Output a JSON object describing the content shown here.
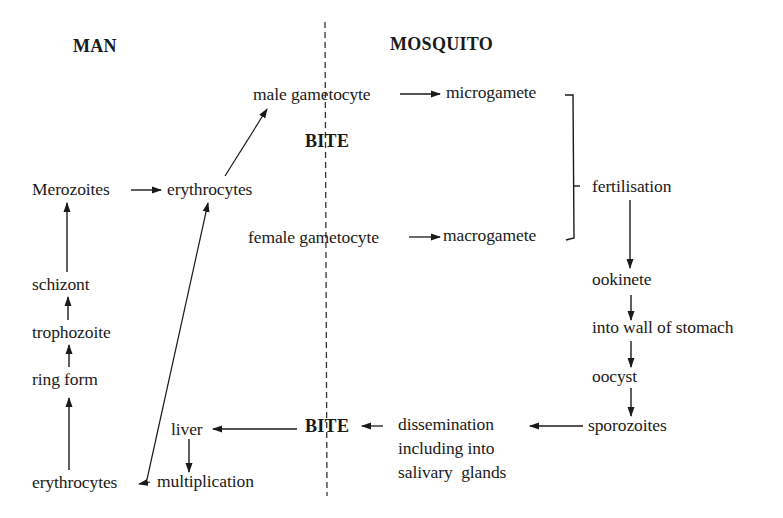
{
  "diagram": {
    "type": "life-cycle flowchart",
    "regions": {
      "left_header": "MAN",
      "right_header": "MOSQUITO",
      "divider": "dashed vertical line separating host (man) and vector (mosquito)"
    },
    "nodes": {
      "male_gametocyte": "male gametocyte",
      "microgamete": "microgamete",
      "bite_upper": "BITE",
      "merozoites": "Merozoites",
      "erythrocytes_top": "erythrocytes",
      "female_gametocyte": "female gametocyte",
      "macrogamete": "macrogamete",
      "fertilisation": "fertilisation",
      "schizont": "schizont",
      "trophozoite": "trophozoite",
      "ring_form": "ring form",
      "ookinete": "ookinete",
      "into_wall": "into wall of stomach",
      "oocyst": "oocyst",
      "sporozoites": "sporozoites",
      "dissemination_line1": "dissemination",
      "dissemination_line2": "including into",
      "dissemination_line3": "salivary  glands",
      "bite_lower": "BITE",
      "liver": "liver",
      "multiplication": "multiplication",
      "erythrocytes_bottom": "erythrocytes"
    },
    "edges": [
      {
        "from": "male gametocyte",
        "to": "microgamete"
      },
      {
        "from": "female gametocyte",
        "to": "macrogamete"
      },
      {
        "from": "microgamete + macrogamete",
        "to": "fertilisation",
        "style": "bracket"
      },
      {
        "from": "fertilisation",
        "to": "ookinete"
      },
      {
        "from": "ookinete",
        "to": "into wall of stomach"
      },
      {
        "from": "into wall of stomach",
        "to": "oocyst"
      },
      {
        "from": "oocyst",
        "to": "sporozoites"
      },
      {
        "from": "sporozoites",
        "to": "dissemination including into salivary glands"
      },
      {
        "from": "dissemination",
        "to": "BITE"
      },
      {
        "from": "BITE",
        "to": "liver"
      },
      {
        "from": "liver",
        "to": "multiplication"
      },
      {
        "from": "multiplication",
        "to": "erythrocytes (bottom)"
      },
      {
        "from": "erythrocytes (bottom)",
        "to": "ring form"
      },
      {
        "from": "ring form",
        "to": "trophozoite"
      },
      {
        "from": "trophozoite",
        "to": "schizont"
      },
      {
        "from": "schizont",
        "to": "Merozoites"
      },
      {
        "from": "Merozoites",
        "to": "erythrocytes (top)"
      },
      {
        "from": "erythrocytes (bottom)",
        "to": "erythrocytes (top)"
      },
      {
        "from": "erythrocytes (top)",
        "to": "male gametocyte"
      }
    ]
  }
}
